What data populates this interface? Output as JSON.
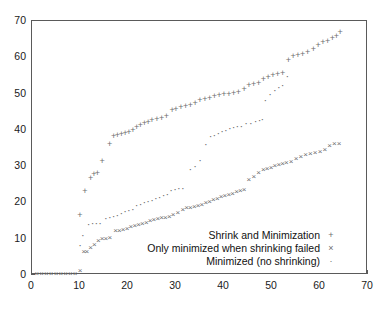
{
  "chart_data": {
    "type": "scatter",
    "title": "",
    "xlabel": "",
    "ylabel": "",
    "xlim": [
      0,
      70
    ],
    "ylim": [
      0,
      70
    ],
    "xticks": [
      0,
      10,
      20,
      30,
      40,
      50,
      60,
      70
    ],
    "yticks": [
      0,
      10,
      20,
      30,
      40,
      50,
      60,
      70
    ],
    "grid": false,
    "legend_position": "lower right",
    "marker_color": "#6e6e6e",
    "axis_color": "#5a5a5a",
    "series": [
      {
        "name": "Shrink and Minimization",
        "marker": "+",
        "marker_glyph": "+",
        "points": [
          [
            10.0,
            16.5
          ],
          [
            11.0,
            23.2
          ],
          [
            12.2,
            26.8
          ],
          [
            12.9,
            27.8
          ],
          [
            13.6,
            28.0
          ],
          [
            14.6,
            31.5
          ],
          [
            16.2,
            36.0
          ],
          [
            17.0,
            38.3
          ],
          [
            17.8,
            38.5
          ],
          [
            18.6,
            38.8
          ],
          [
            19.4,
            39.2
          ],
          [
            20.2,
            39.5
          ],
          [
            21.0,
            39.9
          ],
          [
            21.8,
            40.8
          ],
          [
            22.6,
            41.4
          ],
          [
            23.4,
            42.0
          ],
          [
            24.2,
            42.3
          ],
          [
            25.0,
            42.7
          ],
          [
            26.0,
            43.0
          ],
          [
            27.0,
            43.4
          ],
          [
            28.0,
            43.8
          ],
          [
            29.2,
            45.4
          ],
          [
            30.0,
            45.8
          ],
          [
            31.0,
            46.2
          ],
          [
            32.0,
            46.5
          ],
          [
            33.0,
            46.9
          ],
          [
            34.0,
            47.4
          ],
          [
            35.0,
            48.2
          ],
          [
            36.0,
            48.5
          ],
          [
            37.0,
            48.8
          ],
          [
            38.0,
            49.2
          ],
          [
            39.0,
            49.5
          ],
          [
            40.0,
            49.8
          ],
          [
            41.0,
            50.0
          ],
          [
            42.0,
            50.2
          ],
          [
            43.0,
            50.4
          ],
          [
            44.2,
            51.3
          ],
          [
            45.2,
            52.4
          ],
          [
            46.2,
            52.7
          ],
          [
            47.2,
            53.0
          ],
          [
            48.2,
            54.0
          ],
          [
            49.2,
            54.5
          ],
          [
            50.2,
            55.0
          ],
          [
            51.2,
            55.4
          ],
          [
            52.2,
            55.8
          ],
          [
            53.4,
            59.2
          ],
          [
            54.4,
            60.3
          ],
          [
            55.4,
            60.6
          ],
          [
            56.4,
            61.0
          ],
          [
            57.4,
            61.4
          ],
          [
            58.6,
            62.2
          ],
          [
            59.6,
            63.5
          ],
          [
            60.6,
            64.2
          ],
          [
            61.6,
            64.6
          ],
          [
            62.6,
            65.2
          ],
          [
            63.4,
            66.0
          ],
          [
            64.2,
            67.0
          ]
        ]
      },
      {
        "name": "Only minimized when shrinking failed",
        "marker": "x",
        "marker_glyph": "×",
        "points": [
          [
            1.0,
            0.2
          ],
          [
            2.0,
            0.2
          ],
          [
            3.0,
            0.2
          ],
          [
            4.0,
            0.2
          ],
          [
            5.0,
            0.2
          ],
          [
            6.0,
            0.2
          ],
          [
            7.0,
            0.2
          ],
          [
            8.0,
            0.2
          ],
          [
            9.0,
            0.2
          ],
          [
            10.0,
            1.0
          ],
          [
            10.8,
            6.3
          ],
          [
            11.4,
            6.4
          ],
          [
            12.2,
            7.4
          ],
          [
            13.0,
            8.4
          ],
          [
            13.8,
            9.3
          ],
          [
            14.6,
            9.8
          ],
          [
            15.4,
            10.0
          ],
          [
            16.2,
            10.3
          ],
          [
            17.4,
            12.0
          ],
          [
            18.2,
            12.2
          ],
          [
            19.0,
            12.4
          ],
          [
            19.8,
            12.8
          ],
          [
            20.6,
            13.1
          ],
          [
            21.4,
            13.4
          ],
          [
            22.2,
            13.8
          ],
          [
            23.0,
            14.0
          ],
          [
            23.8,
            14.3
          ],
          [
            24.6,
            14.8
          ],
          [
            25.4,
            15.1
          ],
          [
            26.2,
            15.4
          ],
          [
            27.0,
            15.6
          ],
          [
            27.8,
            15.8
          ],
          [
            28.6,
            16.0
          ],
          [
            29.4,
            16.6
          ],
          [
            30.4,
            17.2
          ],
          [
            31.4,
            18.0
          ],
          [
            32.2,
            18.4
          ],
          [
            33.0,
            18.6
          ],
          [
            33.8,
            18.8
          ],
          [
            34.6,
            19.0
          ],
          [
            35.4,
            19.4
          ],
          [
            36.2,
            19.8
          ],
          [
            37.0,
            20.2
          ],
          [
            37.8,
            20.6
          ],
          [
            38.6,
            21.0
          ],
          [
            39.4,
            21.4
          ],
          [
            40.2,
            21.7
          ],
          [
            41.0,
            22.0
          ],
          [
            41.8,
            22.4
          ],
          [
            42.6,
            22.8
          ],
          [
            43.4,
            23.2
          ],
          [
            44.2,
            23.5
          ],
          [
            45.2,
            26.2
          ],
          [
            46.2,
            27.0
          ],
          [
            47.2,
            28.0
          ],
          [
            48.2,
            28.8
          ],
          [
            49.0,
            29.2
          ],
          [
            49.8,
            29.6
          ],
          [
            50.6,
            30.0
          ],
          [
            51.4,
            30.3
          ],
          [
            52.2,
            30.6
          ],
          [
            53.0,
            30.9
          ],
          [
            54.0,
            31.2
          ],
          [
            55.0,
            32.0
          ],
          [
            56.0,
            32.5
          ],
          [
            57.0,
            33.0
          ],
          [
            58.0,
            33.3
          ],
          [
            59.0,
            33.6
          ],
          [
            60.0,
            34.0
          ],
          [
            61.0,
            34.4
          ],
          [
            62.0,
            35.6
          ],
          [
            63.0,
            36.0
          ],
          [
            64.0,
            36.2
          ]
        ]
      },
      {
        "name": "Minimized (no shrinking)",
        "marker": ".",
        "marker_glyph": "·",
        "points": [
          [
            10.0,
            8.4
          ],
          [
            10.6,
            11.0
          ],
          [
            11.8,
            14.0
          ],
          [
            12.6,
            14.2
          ],
          [
            13.4,
            14.3
          ],
          [
            14.2,
            14.4
          ],
          [
            15.4,
            15.8
          ],
          [
            16.2,
            16.0
          ],
          [
            17.0,
            16.2
          ],
          [
            17.8,
            16.6
          ],
          [
            18.6,
            17.0
          ],
          [
            19.4,
            17.6
          ],
          [
            20.2,
            18.0
          ],
          [
            21.0,
            18.2
          ],
          [
            21.8,
            19.2
          ],
          [
            22.6,
            19.6
          ],
          [
            23.4,
            20.0
          ],
          [
            24.2,
            20.4
          ],
          [
            25.0,
            20.8
          ],
          [
            25.8,
            21.2
          ],
          [
            26.6,
            21.6
          ],
          [
            27.4,
            22.0
          ],
          [
            28.2,
            22.4
          ],
          [
            29.0,
            23.4
          ],
          [
            29.8,
            23.6
          ],
          [
            30.6,
            23.9
          ],
          [
            31.4,
            24.0
          ],
          [
            33.0,
            29.2
          ],
          [
            34.0,
            30.0
          ],
          [
            35.0,
            31.6
          ],
          [
            36.2,
            36.2
          ],
          [
            37.2,
            38.2
          ],
          [
            38.0,
            38.6
          ],
          [
            38.8,
            39.0
          ],
          [
            39.6,
            39.6
          ],
          [
            40.4,
            40.0
          ],
          [
            41.2,
            40.6
          ],
          [
            42.0,
            40.8
          ],
          [
            42.8,
            41.0
          ],
          [
            43.6,
            41.2
          ],
          [
            44.6,
            41.8
          ],
          [
            45.6,
            42.0
          ],
          [
            46.6,
            42.4
          ],
          [
            47.4,
            42.8
          ],
          [
            48.0,
            42.9
          ],
          [
            48.6,
            48.2
          ],
          [
            49.6,
            50.0
          ],
          [
            50.6,
            51.0
          ],
          [
            51.4,
            51.8
          ],
          [
            52.2,
            52.4
          ],
          [
            53.2,
            54.8
          ]
        ]
      }
    ]
  },
  "axes": {
    "x_tick_labels": [
      "0",
      "10",
      "20",
      "30",
      "40",
      "50",
      "60",
      "70"
    ],
    "y_tick_labels": [
      "0",
      "10",
      "20",
      "30",
      "40",
      "50",
      "60",
      "70"
    ]
  },
  "legend": {
    "entries": [
      {
        "label": "Shrink and Minimization",
        "marker": "+"
      },
      {
        "label": "Only minimized when shrinking failed",
        "marker": "×"
      },
      {
        "label": "Minimized (no shrinking)",
        "marker": "·"
      }
    ]
  }
}
